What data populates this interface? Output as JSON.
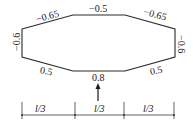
{
  "diagram": {
    "type": "wind-load-shape-coefficient-diagram",
    "coefficients": {
      "top_left_slope": "−0.65",
      "top": "−0.5",
      "top_right_slope": "−0.65",
      "left": "−0.6",
      "right": "−0.6",
      "bottom_left_slope": "0.5",
      "bottom": "0.8",
      "bottom_right_slope": "0.5"
    },
    "wind_direction": "up",
    "dimensions": [
      {
        "label": "l/3"
      },
      {
        "label": "l/3"
      },
      {
        "label": "l/3"
      }
    ],
    "colors": {
      "line": "#2a2a2a",
      "text": "#1a1a1a",
      "background": "#ffffff"
    }
  }
}
